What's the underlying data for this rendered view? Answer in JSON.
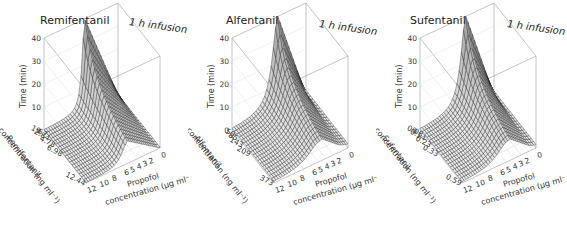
{
  "chart_data": [
    {
      "type": "surface3d",
      "title": "Remifentanil",
      "annotation": "1 h infusion",
      "zlabel": "Time (min)",
      "zticks": [
        "0",
        "10",
        "20",
        "30",
        "40"
      ],
      "zlim": [
        0,
        40
      ],
      "xlabel": "Propofol concentration (µg ml⁻¹)",
      "xticks": [
        "12",
        "10",
        "8",
        "6",
        "5",
        "4",
        "3",
        "2",
        "0"
      ],
      "ylabel": "Remifentanil concentration (ng ml⁻¹)",
      "yticks": [
        "0",
        "1.67",
        "2.84",
        "4.78",
        "6.98",
        "12.44"
      ],
      "grid": true
    },
    {
      "type": "surface3d",
      "title": "Alfentanil",
      "annotation": "1 h infusion",
      "zlabel": "Time (min)",
      "zticks": [
        "0",
        "10",
        "20",
        "30",
        "40"
      ],
      "zlim": [
        0,
        40
      ],
      "xlabel": "Propofol concentration (µg ml⁻¹)",
      "xticks": [
        "12",
        "10",
        "8",
        "6",
        "5",
        "4",
        "3",
        "2",
        "0"
      ],
      "ylabel": "Alfentanil concentration (ng ml⁻¹)",
      "yticks": [
        "0",
        "50",
        "85",
        "143",
        "209",
        "373"
      ],
      "grid": true
    },
    {
      "type": "surface3d",
      "title": "Sufentanil",
      "annotation": "1 h infusion",
      "zlabel": "Time (min)",
      "zticks": [
        "0",
        "10",
        "20",
        "30",
        "40"
      ],
      "zlim": [
        0,
        40
      ],
      "xlabel": "Propofol concentration (µg ml⁻¹)",
      "xticks": [
        "12",
        "10",
        "8",
        "6",
        "5",
        "4",
        "3",
        "2",
        "0"
      ],
      "ylabel": "Sufentanil concentration (ng ml⁻¹)",
      "yticks": [
        "0",
        "0.08",
        "0.14",
        "0.23",
        "0.33",
        "0.59"
      ],
      "grid": true
    }
  ],
  "panels": [
    {
      "title": "Remifentanil",
      "annotation": "1 h infusion",
      "ridge": 0.55,
      "width": 0.1
    },
    {
      "title": "Alfentanil",
      "annotation": "1 h infusion",
      "ridge": 0.62,
      "width": 0.22
    },
    {
      "title": "Sufentanil",
      "annotation": "1 h infusion",
      "ridge": 0.62,
      "width": 0.2
    }
  ]
}
